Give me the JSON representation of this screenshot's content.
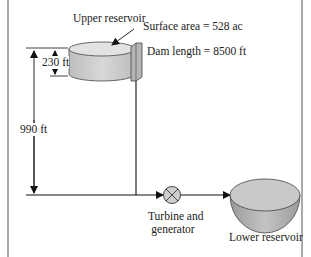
{
  "diagram": {
    "upper_reservoir": {
      "label": "Upper reservoir",
      "surface_area": "Surface area = 528 ac",
      "dam_length": "Dam length = 8500 ft",
      "depth": "230 ft"
    },
    "head": "990 ft",
    "turbine": {
      "label_line1": "Turbine and",
      "label_line2": "generator"
    },
    "lower_reservoir": {
      "label": "Lower reservoir"
    },
    "colors": {
      "reservoir_fill": "#cfcfcf",
      "reservoir_top": "#e4e4e4",
      "bowl_fill": "#bdbdbd",
      "line": "#1a1a1a",
      "border": "#555555"
    }
  }
}
